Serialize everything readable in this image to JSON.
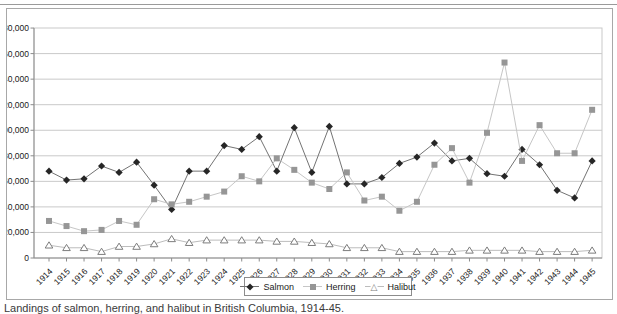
{
  "frame": {
    "background": "#ffffff",
    "border_color": "#a8a8a8",
    "grid_color": "#c9c9c9",
    "axis_color": "#8c8c8c",
    "text_color": "#1a1a1a"
  },
  "chart_data": {
    "type": "line",
    "title": "",
    "xlabel": "",
    "ylabel": "",
    "grid": "horizontal",
    "legend_position": "bottom-center",
    "ylim": [
      0,
      180000
    ],
    "ytick_step": 20000,
    "ytick_labels": [
      "0",
      "20,000",
      "40,000",
      "60,000",
      "80,000",
      "100,000",
      "120,000",
      "140,000",
      "160,000",
      "180,000"
    ],
    "categories": [
      "1914",
      "1915",
      "1916",
      "1917",
      "1918",
      "1919",
      "1920",
      "1921",
      "1922",
      "1923",
      "1924",
      "1925",
      "1926",
      "1927",
      "1928",
      "1929",
      "1930",
      "1931",
      "1932",
      "1933",
      "1934",
      "1935",
      "1936",
      "1937",
      "1938",
      "1939",
      "1940",
      "1941",
      "1942",
      "1943",
      "1944",
      "1945"
    ],
    "series": [
      {
        "name": "Salmon",
        "marker": "diamond",
        "line_color": "#737373",
        "marker_color": "#262626",
        "values": [
          68000,
          61000,
          62000,
          72000,
          67000,
          75000,
          57000,
          38000,
          68000,
          68000,
          88000,
          85000,
          95000,
          68000,
          102000,
          67000,
          103000,
          58000,
          58000,
          63000,
          74000,
          79000,
          90000,
          76000,
          78000,
          66000,
          64000,
          85000,
          73000,
          53000,
          47000,
          76000
        ]
      },
      {
        "name": "Herring",
        "marker": "square",
        "line_color": "#c6c6c6",
        "marker_color": "#969696",
        "values": [
          29000,
          25000,
          21000,
          22000,
          29000,
          26000,
          46000,
          42000,
          44000,
          48000,
          52000,
          64000,
          60000,
          78000,
          69000,
          59000,
          54000,
          67000,
          45000,
          48000,
          37000,
          44000,
          73000,
          86000,
          59000,
          98000,
          153000,
          76000,
          104000,
          82000,
          82000,
          116000
        ]
      },
      {
        "name": "Halibut",
        "marker": "triangle-open",
        "line_color": "#bcbcbc",
        "marker_color": "#ffffff",
        "marker_stroke": "#7d7d7d",
        "values": [
          10000,
          8000,
          8000,
          5000,
          9000,
          9000,
          11000,
          15000,
          12000,
          14000,
          14000,
          14000,
          14000,
          13000,
          13000,
          12000,
          11000,
          8000,
          8000,
          8000,
          5000,
          5000,
          5000,
          5000,
          6000,
          6000,
          6000,
          6000,
          5000,
          5000,
          5000,
          6000
        ]
      }
    ]
  },
  "legend": {
    "icons": [
      "diamond-icon",
      "square-icon",
      "triangle-icon"
    ]
  },
  "caption": {
    "text": "Landings of salmon, herring, and halibut in British Columbia, 1914-45."
  }
}
